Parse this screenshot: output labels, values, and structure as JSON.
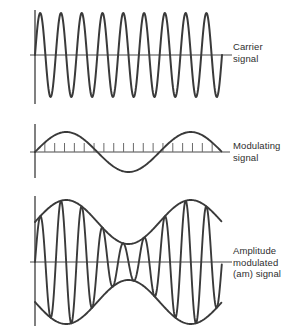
{
  "figure": {
    "background_color": "#ffffff",
    "stroke_color": "#3a3a3a",
    "axis_color": "#4a4a4a",
    "text_color": "#2e2e2e"
  },
  "labels": {
    "carrier": "Carrier\nsignal",
    "modulating": "Modulating\nsignal",
    "am": "Amplitude\nmodulated\n(am) signal"
  },
  "chart_data": {
    "type": "line",
    "xlabel": "",
    "ylabel": "",
    "grid": false,
    "legend_position": "right",
    "panels": [
      {
        "name": "carrier-signal",
        "label": "Carrier signal",
        "waveform": "sine",
        "cycles": 9,
        "amplitude": 42,
        "baseline_y": 55,
        "x_start": 35,
        "x_end": 222,
        "axis_x_end": 232,
        "axis_top": 10,
        "axis_bottom": 104,
        "ticks": false,
        "envelope": false
      },
      {
        "name": "modulating-signal",
        "label": "Modulating signal",
        "waveform": "sine",
        "cycles": 1.5,
        "amplitude": 20,
        "baseline_y": 152,
        "x_start": 35,
        "x_end": 222,
        "axis_x_end": 230,
        "axis_top": 124,
        "axis_bottom": 178,
        "ticks": true,
        "tick_count": 19,
        "tick_height": 9,
        "tick_direction": "up",
        "envelope": false
      },
      {
        "name": "am-signal",
        "label": "Amplitude modulated (am) signal",
        "waveform": "sine-modulated",
        "carrier_cycles": 9,
        "modulation_cycles": 1.5,
        "carrier_amplitude": 62,
        "modulation_depth": 0.55,
        "baseline_y": 262,
        "x_start": 35,
        "x_end": 222,
        "axis_x_end": 232,
        "axis_top": 196,
        "axis_bottom": 326,
        "ticks": false,
        "envelope": true
      }
    ]
  }
}
